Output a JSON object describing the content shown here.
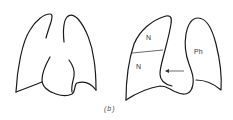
{
  "figure": {
    "caption": "(b)",
    "panels": [
      {
        "id": "left",
        "description": "normal chest outline: both lungs and heart shadow"
      },
      {
        "id": "right",
        "description": "chest outline with labelled regions and arrow"
      }
    ],
    "labels": {
      "upper_n": "N",
      "lower_n": "N",
      "ph": "Ph"
    },
    "colors": {
      "line": "#1a1a1a",
      "background": "#ffffff"
    }
  }
}
